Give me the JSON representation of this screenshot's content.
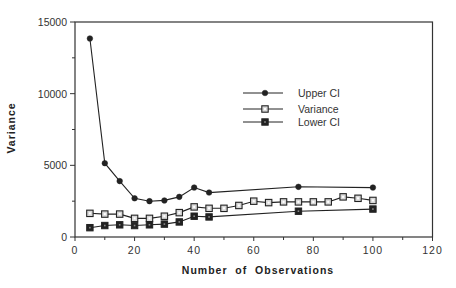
{
  "chart_data": {
    "type": "line",
    "title": "",
    "xlabel": "Number  of  Observations",
    "ylabel": "Variance",
    "xlim": [
      0,
      120
    ],
    "ylim": [
      0,
      15000
    ],
    "x_ticks": [
      0,
      20,
      40,
      60,
      80,
      100,
      120
    ],
    "y_ticks": [
      0,
      5000,
      10000,
      15000
    ],
    "grid": false,
    "legend_position": "upper center-right (inside plot)",
    "series": [
      {
        "name": "Upper CI",
        "marker": "filled-diamond",
        "x": [
          5,
          10,
          15,
          20,
          25,
          30,
          35,
          40,
          45,
          75,
          100
        ],
        "values": [
          13850,
          5150,
          3900,
          2700,
          2500,
          2550,
          2800,
          3450,
          3100,
          3500,
          3450
        ]
      },
      {
        "name": "Variance",
        "marker": "open-square",
        "x": [
          5,
          10,
          15,
          20,
          25,
          30,
          35,
          40,
          45,
          50,
          55,
          60,
          65,
          70,
          75,
          80,
          85,
          90,
          95,
          100
        ],
        "values": [
          1650,
          1600,
          1600,
          1300,
          1300,
          1450,
          1700,
          2100,
          2000,
          2000,
          2200,
          2500,
          2400,
          2450,
          2450,
          2450,
          2450,
          2800,
          2700,
          2550
        ]
      },
      {
        "name": "Lower CI",
        "marker": "filled-square",
        "x": [
          5,
          10,
          15,
          20,
          25,
          30,
          35,
          40,
          45,
          75,
          100
        ],
        "values": [
          650,
          800,
          850,
          800,
          850,
          900,
          1050,
          1450,
          1400,
          1800,
          1950
        ]
      }
    ]
  },
  "colors": {
    "line": "#222222",
    "axis": "#333333",
    "open_marker_fill": "#d8d8d8"
  }
}
